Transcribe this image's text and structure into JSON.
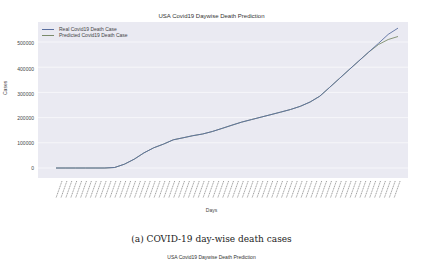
{
  "figure": {
    "title": "USA Covid19 Daywise Death Prediction",
    "caption": "(a) COVID-19 day-wise death cases",
    "next_title": "USA Covid19 Daywise Death Prediction"
  },
  "colors": {
    "plot_bg": "#eaeaf2",
    "real_line": "#5a6fa0",
    "predicted_line": "#7a8a6a"
  },
  "chart_data": {
    "type": "line",
    "title": "USA Covid19 Daywise Death Prediction",
    "xlabel": "Days",
    "ylabel": "Cases",
    "ylim": [
      -20000,
      580000
    ],
    "yticks": [
      0,
      100000,
      200000,
      300000,
      400000,
      500000
    ],
    "ytick_labels": [
      "0",
      "100000",
      "200000",
      "300000",
      "400000",
      "500000"
    ],
    "xtick_labels_note": "dense rotated date labels (illegible)",
    "grid": true,
    "legend_position": "upper left",
    "legend": [
      "Real Covid19 Death Case",
      "Predicted Covid19 Death Case"
    ],
    "x": [
      0,
      10,
      20,
      30,
      40,
      50,
      60,
      70,
      80,
      90,
      100,
      110,
      120,
      130,
      140,
      150,
      160,
      170,
      180,
      190,
      200,
      210,
      220,
      230,
      240,
      250,
      260,
      270,
      280,
      290,
      300,
      310,
      320,
      330,
      340,
      350
    ],
    "series": [
      {
        "name": "Real Covid19 Death Case",
        "values": [
          0,
          0,
          0,
          0,
          0,
          0,
          2000,
          15000,
          35000,
          60000,
          80000,
          95000,
          112000,
          120000,
          128000,
          135000,
          145000,
          157000,
          170000,
          182000,
          192000,
          202000,
          212000,
          222000,
          232000,
          245000,
          262000,
          285000,
          320000,
          355000,
          390000,
          425000,
          460000,
          495000,
          530000,
          555000
        ]
      },
      {
        "name": "Predicted Covid19 Death Case",
        "values": [
          0,
          0,
          0,
          0,
          0,
          0,
          2000,
          15000,
          35000,
          60000,
          80000,
          95000,
          112000,
          120000,
          128000,
          135000,
          145000,
          157000,
          170000,
          182000,
          192000,
          202000,
          212000,
          222000,
          232000,
          245000,
          262000,
          285000,
          320000,
          355000,
          390000,
          425000,
          460000,
          490000,
          510000,
          522000
        ]
      }
    ]
  }
}
